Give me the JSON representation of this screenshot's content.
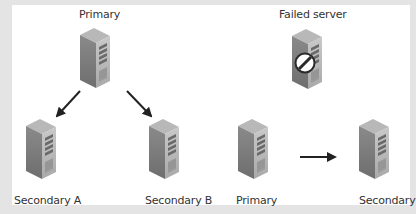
{
  "diagram": {
    "left_panel": {
      "primary": {
        "label": "Primary",
        "icon": "server-icon"
      },
      "secondaries": [
        {
          "label": "Secondary A",
          "icon": "server-icon"
        },
        {
          "label": "Secondary B",
          "icon": "server-icon"
        }
      ],
      "arrows": [
        "primary-to-secondary-a",
        "primary-to-secondary-b"
      ]
    },
    "right_panel": {
      "failed": {
        "label": "Failed server",
        "icon": "failed-server-icon"
      },
      "primary": {
        "label": "Primary",
        "icon": "server-icon"
      },
      "secondary": {
        "label": "Secondary",
        "icon": "server-icon"
      },
      "arrows": [
        "primary-to-secondary"
      ]
    }
  }
}
